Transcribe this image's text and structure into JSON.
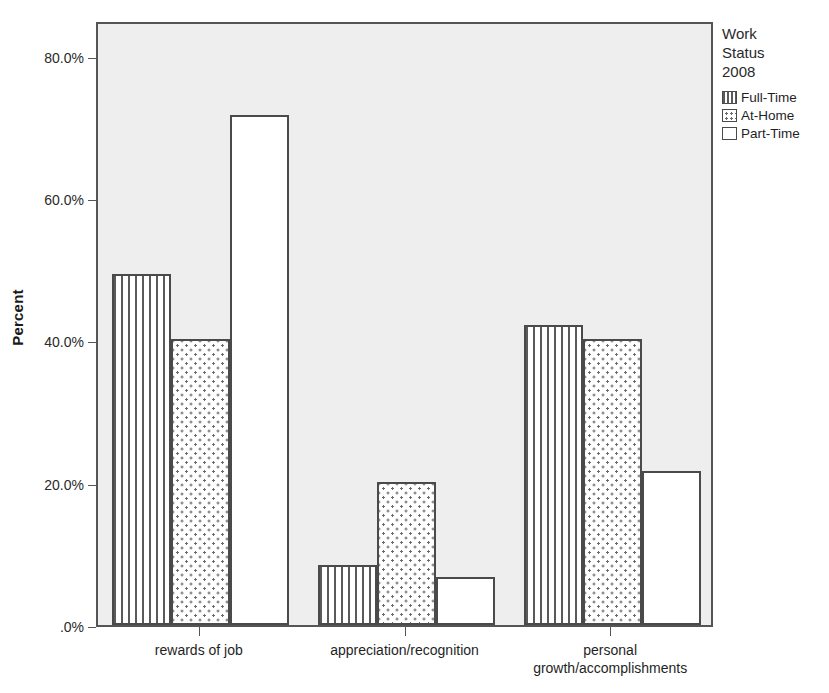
{
  "chart_data": {
    "type": "bar",
    "title": "",
    "subtitle": "",
    "xlabel": "",
    "ylabel": "Percent",
    "ylim": [
      0,
      85
    ],
    "grid": false,
    "categories": [
      "rewards of job",
      "appreciation/recognition",
      "personal\ngrowth/accomplishments"
    ],
    "series": [
      {
        "name": "Full-Time",
        "fill": "striped",
        "values": [
          49.3,
          8.4,
          42.2
        ]
      },
      {
        "name": "At-Home",
        "fill": "dotted",
        "values": [
          40.2,
          20.1,
          40.2
        ]
      },
      {
        "name": "Part-Time",
        "fill": "empty",
        "values": [
          71.6,
          6.7,
          21.6
        ]
      }
    ],
    "y_ticks": [
      {
        "value": 80,
        "label": "80.0%"
      },
      {
        "value": 60,
        "label": "60.0%"
      },
      {
        "value": 40,
        "label": "40.0%"
      },
      {
        "value": 20,
        "label": "20.0%"
      },
      {
        "value": 0,
        "label": ".0%"
      }
    ],
    "legend": {
      "position": "right",
      "title": "Work\nStatus\n2008",
      "entries": [
        {
          "label": "Full-Time",
          "fill": "striped"
        },
        {
          "label": "At-Home",
          "fill": "dotted"
        },
        {
          "label": "Part-Time",
          "fill": "empty"
        }
      ]
    },
    "colors": {
      "plot_background": "#eeeeee",
      "page_background": "#ffffff",
      "axis": "#555555",
      "bar_outline": "#4a4a4a",
      "pattern": "#5a5a5a",
      "text": "#1f1f1f"
    }
  }
}
